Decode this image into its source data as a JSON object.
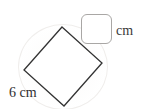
{
  "figure": {
    "type": "geometry-diagram",
    "question_marker": ")",
    "answer_box": {
      "value": "",
      "placeholder": "",
      "unit_label": "cm"
    },
    "side_label": "6 cm",
    "shape": {
      "name": "square",
      "orientation": "rotated-diamond",
      "side_length": 6,
      "side_unit": "cm",
      "stroke_color": "#333333",
      "fill_color": "#ffffff",
      "vertices": [
        {
          "name": "top",
          "x": 62,
          "y": 27
        },
        {
          "name": "right",
          "x": 102,
          "y": 63
        },
        {
          "name": "bottom",
          "x": 64,
          "y": 106
        },
        {
          "name": "left",
          "x": 24,
          "y": 70
        }
      ]
    },
    "colors": {
      "box_border": "#a9a7a5",
      "text": "#2e2e2e",
      "background": "#ffffff"
    }
  }
}
